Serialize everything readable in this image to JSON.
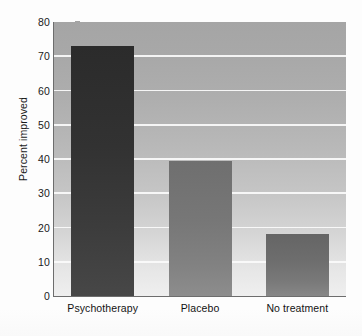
{
  "chart_data": {
    "type": "bar",
    "title": "",
    "subtitle": "",
    "xlabel": "",
    "ylabel": "Percent improved",
    "categories": [
      "Psychotherapy",
      "Placebo",
      "No treatment"
    ],
    "values": [
      73,
      39.5,
      18
    ],
    "ylim": [
      0,
      80
    ],
    "yticks": [
      0,
      10,
      20,
      30,
      40,
      50,
      60,
      70,
      80
    ],
    "ytick_labels": [
      "0",
      "10",
      "20",
      "30",
      "40",
      "50",
      "60",
      "70",
      "80"
    ],
    "grid": true,
    "grid_orientation": "horizontal",
    "grid_color": "#fbfbfb",
    "legend": false,
    "legend_position": "none",
    "bar_colors": [
      "#323232",
      "#7a7a7a",
      "#6e6e6e"
    ],
    "plot_background": "#b5b5b5",
    "axis_color": "#6d6d6d",
    "text_color": "#1a1a1a",
    "series": [
      {
        "name": "Percent improved",
        "values": [
          73,
          39.5,
          18
        ]
      }
    ]
  }
}
